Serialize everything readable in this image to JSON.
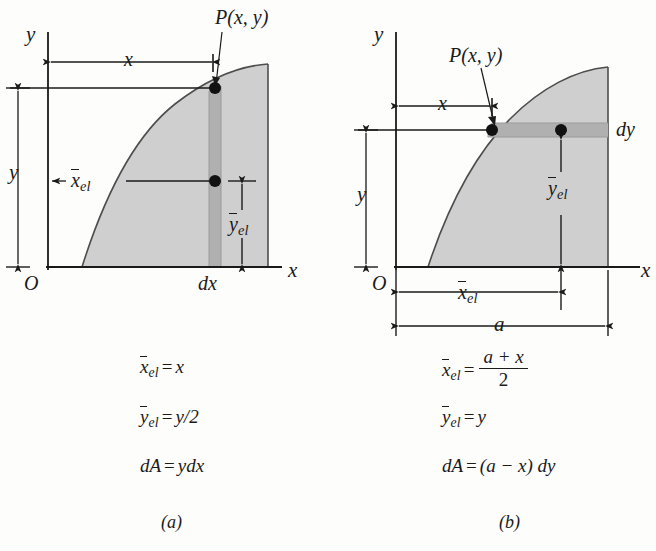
{
  "figure": {
    "caption_a": "(a)",
    "caption_b": "(b)",
    "background_color": "#fdfdfb",
    "ink_color": "#1a1a1a",
    "area_fill_color": "#cfcfcf",
    "strip_fill_color": "#b5b5b5"
  },
  "panel_a": {
    "name": "vertical-strip-element",
    "axis_y_label": "y",
    "axis_x_label": "x",
    "origin_label": "O",
    "point_label": "P(x, y)",
    "dim_x_label": "x",
    "dim_y_label": "y",
    "dim_xel_label_base": "x",
    "dim_xel_label_sub": "el",
    "dim_yel_label_base": "y",
    "dim_yel_label_sub": "el",
    "strip_label": "dx",
    "equations": [
      {
        "id": "xel",
        "lhs_base": "x",
        "lhs_sub": "el",
        "op": "=",
        "rhs": "x"
      },
      {
        "id": "yel",
        "lhs_base": "y",
        "lhs_sub": "el",
        "op": "=",
        "rhs": "y/2"
      },
      {
        "id": "dA",
        "lhs_base": "dA",
        "lhs_sub": "",
        "op": "=",
        "rhs": "ydx"
      }
    ]
  },
  "panel_b": {
    "name": "horizontal-strip-element",
    "axis_y_label": "y",
    "axis_x_label": "x",
    "origin_label": "O",
    "point_label": "P(x, y)",
    "dim_x_label": "x",
    "dim_y_label": "y",
    "dim_xel_label_base": "x",
    "dim_xel_label_sub": "el",
    "dim_yel_label_base": "y",
    "dim_yel_label_sub": "el",
    "dim_a_label": "a",
    "strip_label": "dy",
    "equations": [
      {
        "id": "xel",
        "lhs_base": "x",
        "lhs_sub": "el",
        "op": "=",
        "numerator": "a + x",
        "denominator": "2"
      },
      {
        "id": "yel",
        "lhs_base": "y",
        "lhs_sub": "el",
        "op": "=",
        "rhs": "y"
      },
      {
        "id": "dA",
        "lhs_base": "dA",
        "lhs_sub": "",
        "op": "=",
        "rhs": "(a − x) dy"
      }
    ]
  }
}
